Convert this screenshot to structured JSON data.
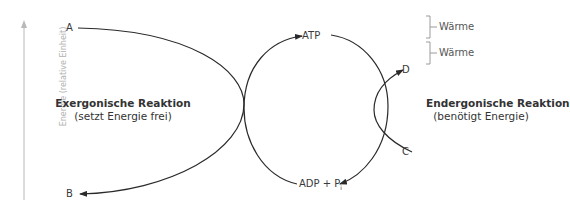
{
  "axis": {
    "label": "Energie (relative Einheit)",
    "color": "#b0b0b0"
  },
  "left_reaction": {
    "title": "Exergonische Reaktion",
    "subtitle": "(setzt Energie frei)"
  },
  "right_reaction": {
    "title": "Endergonische Reaktion",
    "subtitle": "(benötigt Energie)"
  },
  "nodes": {
    "A": "A",
    "B": "B",
    "C": "C",
    "D": "D",
    "ATP": "ATP",
    "ADP": "ADP + P",
    "ADP_sub": "i"
  },
  "heat": [
    {
      "label": "Wärme"
    },
    {
      "label": "Wärme"
    }
  ],
  "colors": {
    "line": "#2a2a2a",
    "text": "#3a3a3a",
    "bracket": "#9a9a9a"
  }
}
